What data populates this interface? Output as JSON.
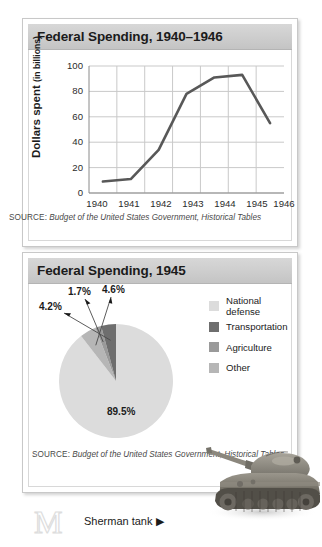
{
  "panels": {
    "line": {
      "title": "Federal Spending, 1940–1946",
      "source_label": "SOURCE:",
      "source_text": "Budget of the United States Government, Historical Tables"
    },
    "pie": {
      "title": "Federal Spending, 1945",
      "source_label": "SOURCE:",
      "source_text": "Budget of the United States Government, Historical Tables"
    }
  },
  "caption": {
    "text": "Sherman tank ▶",
    "watermark_glyph": "M"
  },
  "colors": {
    "national_defense": "#dcdcdc",
    "transportation": "#6e6e6e",
    "agriculture": "#9a9a9a",
    "other": "#b6b6b6",
    "line": "#585858",
    "grid": "#c9c9c9",
    "axis": "#8a8a8a",
    "header_bar": "#cfcfcf"
  },
  "chart_data": [
    {
      "type": "line",
      "title": "Federal Spending, 1940–1946",
      "xlabel": "",
      "ylabel": "Dollars spent",
      "ylabel_sub": "(in billions)",
      "categories": [
        "1940",
        "1941",
        "1942",
        "1943",
        "1944",
        "1945",
        "1946"
      ],
      "values": [
        9,
        11,
        34,
        78,
        91,
        93,
        55
      ],
      "ylim": [
        0,
        100
      ],
      "yticks": [
        0,
        20,
        40,
        60,
        80,
        100
      ],
      "grid": true,
      "legend": "none"
    },
    {
      "type": "pie",
      "title": "Federal Spending, 1945",
      "labels": [
        "National defense",
        "Transportation",
        "Agriculture",
        "Other"
      ],
      "values": [
        89.5,
        4.2,
        1.7,
        4.6
      ],
      "value_labels": [
        "89.5%",
        "4.2%",
        "1.7%",
        "4.6%"
      ],
      "colors": [
        "#dcdcdc",
        "#6e6e6e",
        "#9a9a9a",
        "#b6b6b6"
      ],
      "legend": "right",
      "grid": false
    }
  ]
}
